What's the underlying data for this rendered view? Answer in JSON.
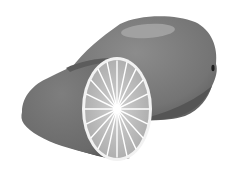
{
  "image": {
    "subject": "Lemon with cut half",
    "style": "grayscale illustration",
    "colors": {
      "background": "#ffffff",
      "peel_dark": "#4a4a4a",
      "peel_mid": "#6e6e6e",
      "peel_light": "#8a8a8a",
      "highlight": "#a6a6a6",
      "flesh": "#b9b9b9",
      "rind_ring": "#f2f2f2",
      "segments": "#ffffff",
      "tip": "#1e1e1e"
    },
    "segment_count": 20
  }
}
